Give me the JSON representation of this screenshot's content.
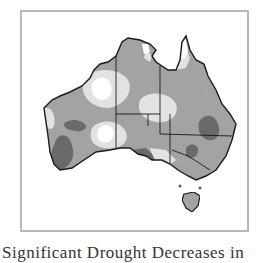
{
  "figure": {
    "caption": "Significant Drought Decreases in",
    "frame_color": "#b8b8b8"
  },
  "map": {
    "region": "Australia",
    "legend_shades": {
      "white": "#ffffff",
      "light": "#e2e2e2",
      "medium": "#a8a8a8",
      "dark": "#6a6a6a"
    },
    "outline_color": "#1a1a1a"
  }
}
